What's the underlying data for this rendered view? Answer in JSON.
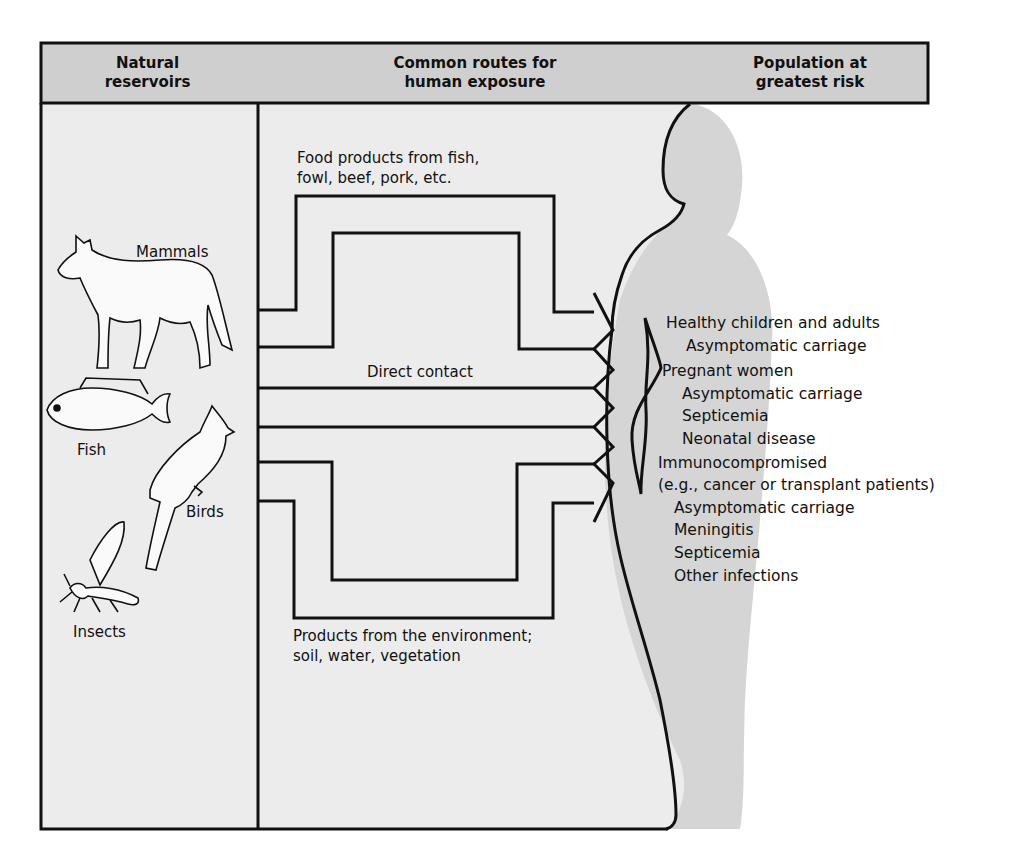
{
  "header": {
    "columns": [
      {
        "title": "Natural reservoirs",
        "line1": "Natural",
        "line2": "reservoirs"
      },
      {
        "title": "Common routes for human exposure",
        "line1": "Common routes for",
        "line2": "human exposure"
      },
      {
        "title": "Population at greatest risk",
        "line1": "Population at",
        "line2": "greatest risk"
      }
    ]
  },
  "reservoirs": [
    {
      "label": "Mammals",
      "icon": "wolf-icon"
    },
    {
      "label": "Fish",
      "icon": "fish-icon"
    },
    {
      "label": "Birds",
      "icon": "bird-icon"
    },
    {
      "label": "Insects",
      "icon": "insect-icon"
    }
  ],
  "routes": {
    "food": {
      "line1": "Food products from fish,",
      "line2": "fowl, beef, pork, etc."
    },
    "direct": {
      "label": "Direct contact"
    },
    "environment": {
      "line1": "Products from the environment;",
      "line2": "soil, water, vegetation"
    }
  },
  "populations": [
    {
      "group": "Healthy children and adults",
      "outcomes": [
        "Asymptomatic carriage"
      ]
    },
    {
      "group": "Pregnant women",
      "outcomes": [
        "Asymptomatic carriage",
        "Septicemia",
        "Neonatal disease"
      ]
    },
    {
      "group": "Immunocompromised",
      "note": "(e.g., cancer or transplant patients)",
      "outcomes": [
        "Asymptomatic carriage",
        "Meningitis",
        "Septicemia",
        "Other infections"
      ]
    }
  ],
  "colors": {
    "header_fill": "#cfcfcf",
    "panel_fill": "#ececec",
    "silhouette_fill": "#d5d5d5",
    "line": "#111111"
  }
}
